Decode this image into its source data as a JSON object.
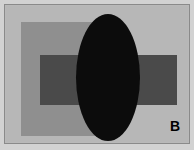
{
  "figure": {
    "panel_label": "B",
    "background_color": "#b7b7b7",
    "frame_color": "#8a8a8a",
    "outer_margin_color": "#d2d2d2",
    "label_color": "#000000",
    "width": 194,
    "height": 150
  },
  "shapes": [
    {
      "name": "vertical-rectangle",
      "type": "rectangle",
      "color": "#8f8f8f",
      "x": 15,
      "y": 16,
      "width": 78,
      "height": 114
    },
    {
      "name": "horizontal-rectangle",
      "type": "rectangle",
      "color": "#4a4a4a",
      "x": 34,
      "y": 49,
      "width": 137,
      "height": 50
    },
    {
      "name": "center-ellipse",
      "type": "ellipse",
      "color": "#0c0c0c",
      "x": 70,
      "y": 8,
      "width": 64,
      "height": 127
    }
  ]
}
